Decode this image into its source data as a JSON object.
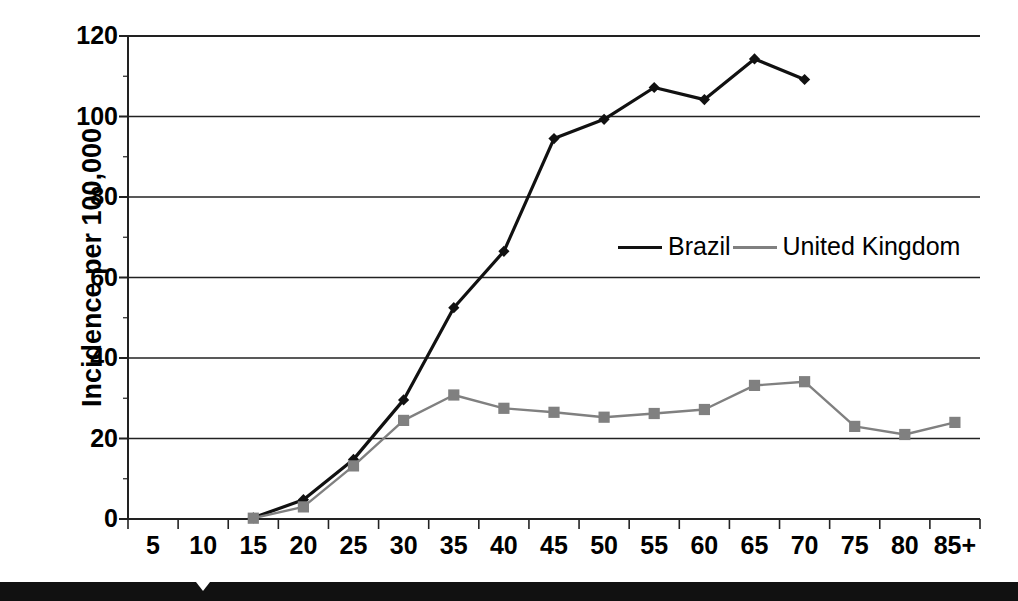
{
  "chart_data": {
    "type": "line",
    "title": "",
    "xlabel": "",
    "ylabel": "Incidence per 100,000",
    "x": [
      "5",
      "10",
      "15",
      "20",
      "25",
      "30",
      "35",
      "40",
      "45",
      "50",
      "55",
      "60",
      "65",
      "70",
      "75",
      "80",
      "85+"
    ],
    "xticks": [
      "5",
      "10",
      "15",
      "20",
      "25",
      "30",
      "35",
      "40",
      "45",
      "50",
      "55",
      "60",
      "65",
      "70",
      "75",
      "80",
      "85+"
    ],
    "yticks": [
      "0",
      "20",
      "40",
      "60",
      "80",
      "100",
      "120"
    ],
    "ylim": [
      0,
      120
    ],
    "grid": true,
    "legend_position": "inside-center-right",
    "series": [
      {
        "name": "Brazil",
        "color": "#111111",
        "marker": "diamond",
        "values": [
          null,
          null,
          0.3,
          4.8,
          14.8,
          29.6,
          52.5,
          66.5,
          94.5,
          99.3,
          107.2,
          104.2,
          114.3,
          109.2,
          null,
          null,
          null
        ]
      },
      {
        "name": "United Kingdom",
        "color": "#808080",
        "marker": "square",
        "values": [
          null,
          null,
          0.2,
          3.0,
          13.2,
          24.5,
          30.8,
          27.5,
          26.5,
          25.3,
          26.2,
          27.2,
          33.2,
          34.1,
          23.0,
          21.0,
          24.0
        ]
      }
    ]
  },
  "legend": {
    "entries": [
      {
        "label": "Brazil"
      },
      {
        "label": "United Kingdom"
      }
    ]
  },
  "axes": {
    "y_title": "Incidence per 100,000"
  },
  "colors": {
    "brazil": "#111111",
    "uk": "#808080",
    "grid": "#222222",
    "background": "#ffffff"
  }
}
